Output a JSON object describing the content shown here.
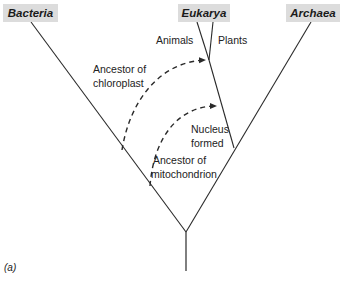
{
  "domains": {
    "bacteria": "Bacteria",
    "eukarya": "Eukarya",
    "archaea": "Archaea"
  },
  "branches": {
    "animals": "Animals",
    "plants": "Plants"
  },
  "annotations": {
    "chloroplast_line1": "Ancestor of",
    "chloroplast_line2": "chloroplast",
    "nucleus_line1": "Nucleus",
    "nucleus_line2": "formed",
    "mitochondrion_line1": "Ancestor of",
    "mitochondrion_line2": "mitochondrion"
  },
  "caption": "(a)",
  "colors": {
    "line": "#2a2a2a",
    "label_bg": "#dcdcdc"
  }
}
